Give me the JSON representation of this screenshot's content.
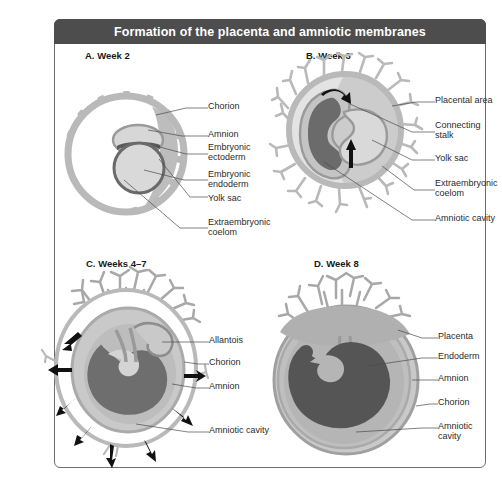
{
  "header": {
    "title": "Formation of the placenta and amniotic membranes"
  },
  "colors": {
    "header_bg": "#4d4d4d",
    "header_text": "#ffffff",
    "frame_border": "#6d6d6d",
    "chorion_gray": "#b9b9b9",
    "mid_gray": "#9a9a9a",
    "dark_gray": "#6a6a6a",
    "darkest_gray": "#4f4f4f",
    "light_fill": "#d7d7d7",
    "pale_fill": "#e9e9e9",
    "arrow": "#111111",
    "leader_line": "#4a4a4a",
    "label_text": "#2b2b2b"
  },
  "panels": [
    {
      "id": "A",
      "title": "A. Week 2",
      "labels": [
        {
          "text": "Chorion"
        },
        {
          "text": "Amnion"
        },
        {
          "text": "Embryonic",
          "text2": "ectoderm"
        },
        {
          "text": "Embryonic",
          "text2": "endoderm"
        },
        {
          "text": "Yolk sac"
        },
        {
          "text": "Extraembryonic",
          "text2": "coelom"
        }
      ]
    },
    {
      "id": "B",
      "title": "B. Week 3",
      "labels": [
        {
          "text": "Placental area"
        },
        {
          "text": "Connecting",
          "text2": "stalk"
        },
        {
          "text": "Yolk sac"
        },
        {
          "text": "Extraembryonic",
          "text2": "coelom"
        },
        {
          "text": "Amniotic cavity"
        }
      ]
    },
    {
      "id": "C",
      "title": "C. Weeks 4–7",
      "labels": [
        {
          "text": "Allantois"
        },
        {
          "text": "Chorion"
        },
        {
          "text": "Amnion"
        },
        {
          "text": "Amniotic cavity"
        }
      ]
    },
    {
      "id": "D",
      "title": "D. Week 8",
      "labels": [
        {
          "text": "Placenta"
        },
        {
          "text": "Endoderm"
        },
        {
          "text": "Amnion"
        },
        {
          "text": "Chorion"
        },
        {
          "text": "Amniotic",
          "text2": "cavity"
        }
      ]
    }
  ]
}
